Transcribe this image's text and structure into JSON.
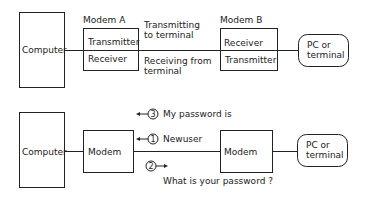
{
  "top_diagram": {
    "computer_label": "Computer",
    "modem_a": {
      "title": "Modem A",
      "upper": "Transmitter",
      "lower": "Receiver"
    },
    "modem_b": {
      "title": "Modem B",
      "upper": "Receiver",
      "lower": "Transmitter"
    },
    "link_upper_label": [
      "Transmitting",
      "to terminal"
    ],
    "link_lower_label": [
      "Receiving from",
      "terminal"
    ],
    "terminal_label": [
      "PC or",
      "terminal"
    ]
  },
  "bottom_diagram": {
    "computer_label": "Computer",
    "modem_left_label": "Modem",
    "modem_right_label": "Modem",
    "terminal_label": [
      "PC or",
      "terminal"
    ],
    "steps": [
      {
        "num": "3",
        "text": "My password is",
        "direction": "left"
      },
      {
        "num": "1",
        "text": "Newuser",
        "direction": "left"
      },
      {
        "num": "2",
        "text": "What is your password ?",
        "direction": "right"
      }
    ]
  }
}
